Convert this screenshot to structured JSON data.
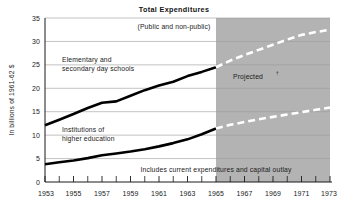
{
  "chart_data": {
    "type": "line",
    "title": "Total Expenditures",
    "subtitle": "(Public and non-public)",
    "xlabel": "",
    "ylabel": "In billions of 1961-62 $",
    "xlim": [
      1953,
      1973
    ],
    "ylim": [
      0,
      35
    ],
    "ytick_labels": [
      "0",
      "5",
      "10",
      "15",
      "20",
      "25",
      "30",
      "35"
    ],
    "ytick_values": [
      0,
      5,
      10,
      15,
      20,
      25,
      30,
      35
    ],
    "xtick_labels": [
      "1953",
      "1955",
      "1957",
      "1959",
      "1961",
      "1963",
      "1965",
      "1967",
      "1969",
      "1971",
      "1973"
    ],
    "xtick_values": [
      1953,
      1955,
      1957,
      1959,
      1961,
      1963,
      1965,
      1967,
      1969,
      1971,
      1973
    ],
    "xtick_minor_values": [
      1954,
      1956,
      1958,
      1960,
      1962,
      1964,
      1966,
      1968,
      1970,
      1972
    ],
    "grid": "horizontal",
    "legend_position": "inline-annotations",
    "x": [
      1953,
      1954,
      1955,
      1956,
      1957,
      1958,
      1959,
      1960,
      1961,
      1962,
      1963,
      1964,
      1965,
      1966,
      1967,
      1968,
      1969,
      1970,
      1971,
      1972,
      1973
    ],
    "series": [
      {
        "name": "Elementary and secondary day schools",
        "values": [
          12.1,
          13.3,
          14.5,
          15.8,
          16.9,
          17.2,
          18.4,
          19.6,
          20.6,
          21.4,
          22.6,
          23.5,
          24.5,
          25.9,
          27.1,
          28.2,
          29.3,
          30.4,
          31.4,
          32.0,
          32.5
        ],
        "actual_through": 1965,
        "style_actual": "solid-black",
        "style_projected": "dashed-white"
      },
      {
        "name": "Institutions of higher education",
        "values": [
          3.8,
          4.2,
          4.6,
          5.1,
          5.7,
          6.1,
          6.5,
          7.0,
          7.6,
          8.3,
          9.1,
          10.2,
          11.4,
          12.2,
          12.8,
          13.4,
          13.9,
          14.4,
          14.9,
          15.4,
          15.9
        ],
        "actual_through": 1965,
        "style_actual": "solid-black",
        "style_projected": "dashed-white"
      }
    ],
    "projected_band": {
      "label": "Projected",
      "label_superscript": "†",
      "start_year": 1965,
      "end_year": 1973,
      "fill_color": "#b3b3b3"
    },
    "annotations": [
      {
        "id": "elementary-label",
        "line1": "Elementary and",
        "line2": "secondary day schools"
      },
      {
        "id": "higher-ed-label",
        "line1": "Institutions of",
        "line2": "higher education"
      },
      {
        "id": "footnote",
        "text": "Includes current expenditures and capital outlay"
      }
    ],
    "colors": {
      "line": "#000000",
      "projected_line": "#ffffff",
      "shade": "#b3b3b3",
      "grid": "#9a9a9a",
      "background": "#ffffff",
      "text": "#1a1a1a"
    }
  }
}
